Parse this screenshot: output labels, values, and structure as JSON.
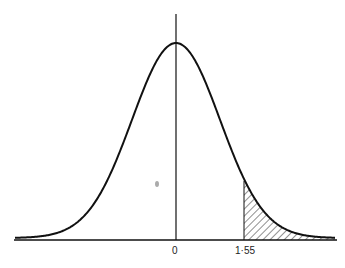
{
  "figure": {
    "type": "normal-distribution-curve",
    "labels": {
      "mean": "0",
      "critical_value": "1·55"
    },
    "shaded_region": "right tail beyond 1·55",
    "colors": {
      "stroke": "#111111",
      "background": "#ffffff"
    }
  }
}
